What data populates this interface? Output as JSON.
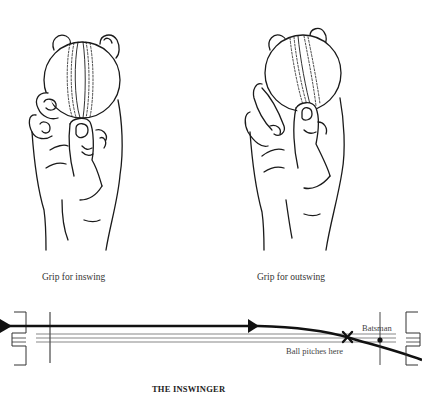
{
  "figures": [
    {
      "id": "inswing",
      "caption": "Grip for inswing"
    },
    {
      "id": "outswing",
      "caption": "Grip for outswing"
    }
  ],
  "diagram": {
    "title": "THE INSWINGER",
    "labels": {
      "batsman": "Batsman",
      "pitch_point": "Ball pitches here"
    }
  },
  "colors": {
    "ink": "#1a1a1a",
    "background": "#ffffff"
  }
}
